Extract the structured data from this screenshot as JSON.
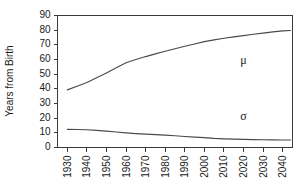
{
  "chart_data": {
    "type": "line",
    "title": "",
    "xlabel": "",
    "ylabel": "Years from Birth",
    "xlim": [
      1925,
      2045
    ],
    "ylim": [
      0,
      90
    ],
    "grid": false,
    "legend_position": "inline-annotation",
    "x_tick_labels": [
      "1930",
      "1940",
      "1950",
      "1960",
      "1970",
      "1980",
      "1990",
      "2000",
      "2010",
      "2020",
      "2030",
      "2040"
    ],
    "x_ticks": [
      1930,
      1940,
      1950,
      1960,
      1970,
      1980,
      1990,
      2000,
      2010,
      2020,
      2030,
      2040
    ],
    "y_tick_labels": [
      "0",
      "10",
      "20",
      "30",
      "40",
      "50",
      "60",
      "70",
      "80",
      "90"
    ],
    "y_ticks": [
      0,
      10,
      20,
      30,
      40,
      50,
      60,
      70,
      80,
      90
    ],
    "x": [
      1930,
      1935,
      1940,
      1945,
      1950,
      1955,
      1960,
      1965,
      1970,
      1975,
      1980,
      1985,
      1990,
      1995,
      2000,
      2005,
      2010,
      2015,
      2020,
      2025,
      2030,
      2035,
      2040,
      2044
    ],
    "series": [
      {
        "name": "μ",
        "label": "mu",
        "annotation": "μ",
        "color": "#4a4a4a",
        "values": [
          39.3,
          41.8,
          44.3,
          47.5,
          50.8,
          54.4,
          57.8,
          60.0,
          62.0,
          63.8,
          65.6,
          67.3,
          69.0,
          70.6,
          72.2,
          73.4,
          74.5,
          75.4,
          76.3,
          77.2,
          78.0,
          78.8,
          79.5,
          79.8
        ]
      },
      {
        "name": "σ",
        "label": "sigma",
        "annotation": "σ",
        "color": "#4a4a4a",
        "values": [
          12.4,
          12.3,
          12.1,
          11.7,
          11.2,
          10.6,
          10.0,
          9.5,
          9.1,
          8.8,
          8.4,
          8.0,
          7.5,
          7.1,
          6.7,
          6.2,
          5.9,
          5.7,
          5.5,
          5.4,
          5.3,
          5.2,
          5.1,
          5.1
        ]
      }
    ],
    "annotations": [
      {
        "text": "μ",
        "x": 2020,
        "y": 57
      },
      {
        "text": "σ",
        "x": 2020,
        "y": 19
      }
    ]
  },
  "axis": {
    "y_title": "Years from Birth"
  }
}
